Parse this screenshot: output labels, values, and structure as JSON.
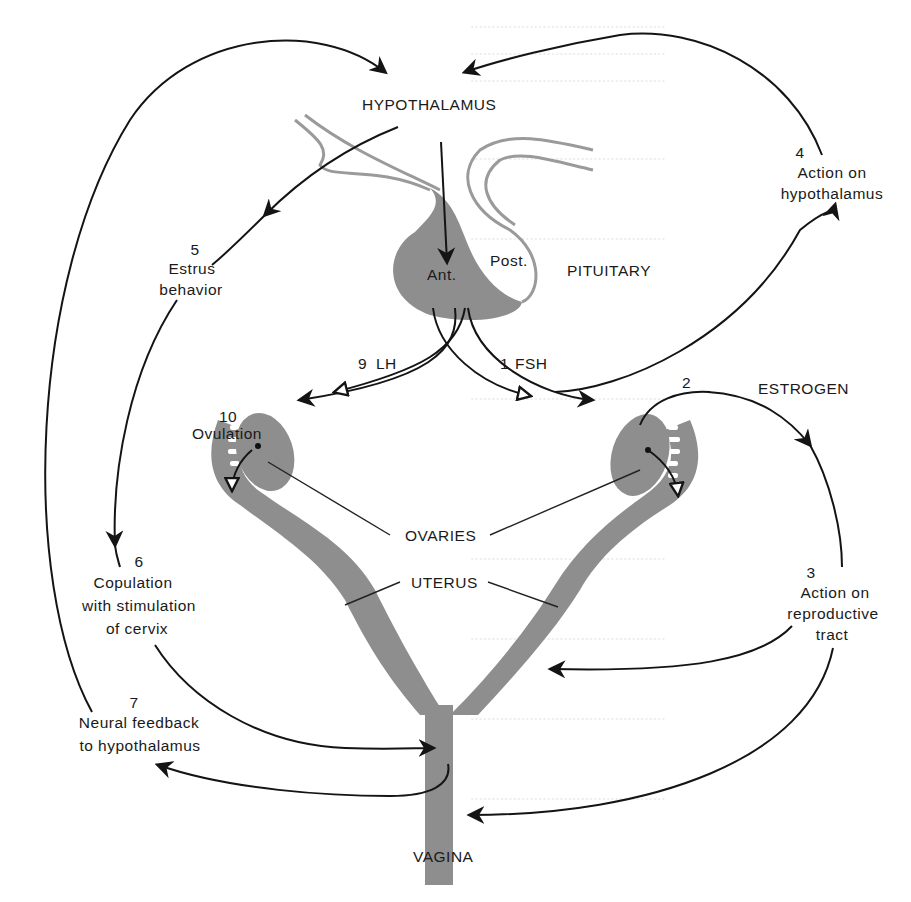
{
  "diagram": {
    "colors": {
      "tissue": "#8e8e8e",
      "line": "#141414",
      "background": "#ffffff",
      "background_text": "#ececec"
    },
    "structures": {
      "hypothalamus": "HYPOTHALAMUS",
      "pituitary": "PITUITARY",
      "anterior": "Ant.",
      "posterior": "Post.",
      "ovaries": "OVARIES",
      "uterus": "UTERUS",
      "vagina": "VAGINA",
      "estrogen": "ESTROGEN"
    },
    "steps": [
      {
        "num": "1",
        "label": "FSH"
      },
      {
        "num": "2",
        "label": ""
      },
      {
        "num": "3",
        "line1": "Action on",
        "line2": "reproductive",
        "line3": "tract"
      },
      {
        "num": "4",
        "line1": "Action on",
        "line2": "hypothalamus"
      },
      {
        "num": "5",
        "line1": "Estrus",
        "line2": "behavior"
      },
      {
        "num": "6",
        "line1": "Copulation",
        "line2": "with stimulation",
        "line3": "of cervix"
      },
      {
        "num": "7",
        "line1": "Neural feedback",
        "line2": "to hypothalamus"
      },
      {
        "num": "9",
        "label": "LH"
      },
      {
        "num": "10",
        "line1": "Ovulation"
      }
    ]
  }
}
